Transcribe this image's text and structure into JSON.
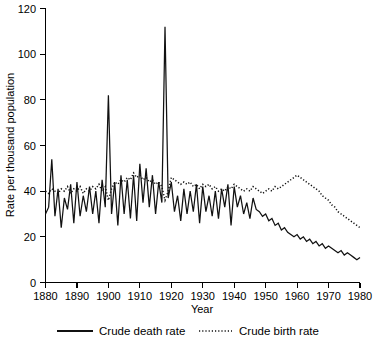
{
  "chart_data": {
    "type": "line",
    "title": "",
    "xlabel": "Year",
    "ylabel": "Rate per thousand population",
    "xlim": [
      1880,
      1980
    ],
    "ylim": [
      0,
      120
    ],
    "xticks": [
      1880,
      1890,
      1900,
      1910,
      1920,
      1930,
      1940,
      1950,
      1960,
      1970,
      1980
    ],
    "yticks": [
      0,
      20,
      40,
      60,
      80,
      100,
      120
    ],
    "grid": false,
    "legend_position": "bottom",
    "series": [
      {
        "name": "Crude death rate",
        "style": "solid",
        "x": [
          1880,
          1881,
          1882,
          1883,
          1884,
          1885,
          1886,
          1887,
          1888,
          1889,
          1890,
          1891,
          1892,
          1893,
          1894,
          1895,
          1896,
          1897,
          1898,
          1899,
          1900,
          1901,
          1902,
          1903,
          1904,
          1905,
          1906,
          1907,
          1908,
          1909,
          1910,
          1911,
          1912,
          1913,
          1914,
          1915,
          1916,
          1917,
          1918,
          1919,
          1920,
          1921,
          1922,
          1923,
          1924,
          1925,
          1926,
          1927,
          1928,
          1929,
          1930,
          1931,
          1932,
          1933,
          1934,
          1935,
          1936,
          1937,
          1938,
          1939,
          1940,
          1941,
          1942,
          1943,
          1944,
          1945,
          1946,
          1947,
          1948,
          1949,
          1950,
          1951,
          1952,
          1953,
          1954,
          1955,
          1956,
          1957,
          1958,
          1959,
          1960,
          1961,
          1962,
          1963,
          1964,
          1965,
          1966,
          1967,
          1968,
          1969,
          1970,
          1971,
          1972,
          1973,
          1974,
          1975,
          1976,
          1977,
          1978,
          1979,
          1980
        ],
        "values": [
          30,
          33,
          54,
          29,
          41,
          24,
          37,
          32,
          43,
          26,
          44,
          29,
          38,
          31,
          42,
          30,
          40,
          26,
          45,
          33,
          82,
          30,
          44,
          25,
          47,
          30,
          45,
          28,
          47,
          27,
          52,
          35,
          50,
          33,
          47,
          30,
          44,
          35,
          112,
          37,
          44,
          31,
          38,
          27,
          41,
          30,
          40,
          31,
          43,
          26,
          42,
          31,
          38,
          29,
          40,
          28,
          41,
          33,
          43,
          25,
          42,
          33,
          38,
          30,
          35,
          28,
          37,
          32,
          31,
          29,
          30,
          27,
          28,
          25,
          26,
          23,
          24,
          22,
          21,
          20,
          21,
          19,
          20,
          18,
          19,
          17,
          18,
          16,
          17,
          15,
          16,
          15,
          14,
          13,
          14,
          12,
          13,
          12,
          11,
          10,
          11
        ]
      },
      {
        "name": "Crude birth rate",
        "style": "dotted",
        "x": [
          1880,
          1881,
          1882,
          1883,
          1884,
          1885,
          1886,
          1887,
          1888,
          1889,
          1890,
          1891,
          1892,
          1893,
          1894,
          1895,
          1896,
          1897,
          1898,
          1899,
          1900,
          1901,
          1902,
          1903,
          1904,
          1905,
          1906,
          1907,
          1908,
          1909,
          1910,
          1911,
          1912,
          1913,
          1914,
          1915,
          1916,
          1917,
          1918,
          1919,
          1920,
          1921,
          1922,
          1923,
          1924,
          1925,
          1926,
          1927,
          1928,
          1929,
          1930,
          1931,
          1932,
          1933,
          1934,
          1935,
          1936,
          1937,
          1938,
          1939,
          1940,
          1941,
          1942,
          1943,
          1944,
          1945,
          1946,
          1947,
          1948,
          1949,
          1950,
          1951,
          1952,
          1953,
          1954,
          1955,
          1956,
          1957,
          1958,
          1959,
          1960,
          1961,
          1962,
          1963,
          1964,
          1965,
          1966,
          1967,
          1968,
          1969,
          1970,
          1971,
          1972,
          1973,
          1974,
          1975,
          1976,
          1977,
          1978,
          1979,
          1980
        ],
        "values": [
          40,
          39,
          41,
          40,
          39,
          41,
          40,
          42,
          39,
          41,
          40,
          42,
          39,
          41,
          40,
          42,
          41,
          43,
          40,
          42,
          36,
          41,
          44,
          43,
          45,
          44,
          46,
          45,
          48,
          46,
          47,
          45,
          46,
          44,
          45,
          43,
          44,
          42,
          36,
          40,
          46,
          45,
          44,
          43,
          44,
          43,
          44,
          42,
          43,
          41,
          43,
          42,
          43,
          41,
          42,
          40,
          41,
          40,
          42,
          41,
          43,
          42,
          41,
          40,
          41,
          40,
          42,
          41,
          40,
          39,
          40,
          41,
          40,
          42,
          41,
          42,
          43,
          44,
          45,
          46,
          47,
          46,
          45,
          44,
          43,
          42,
          41,
          40,
          38,
          37,
          36,
          34,
          33,
          31,
          30,
          29,
          28,
          27,
          26,
          25,
          24
        ]
      }
    ]
  },
  "legend": {
    "items": [
      {
        "label": "Crude death rate",
        "style": "solid"
      },
      {
        "label": "Crude birth rate",
        "style": "dotted"
      }
    ]
  },
  "caption": {
    "text": ""
  }
}
